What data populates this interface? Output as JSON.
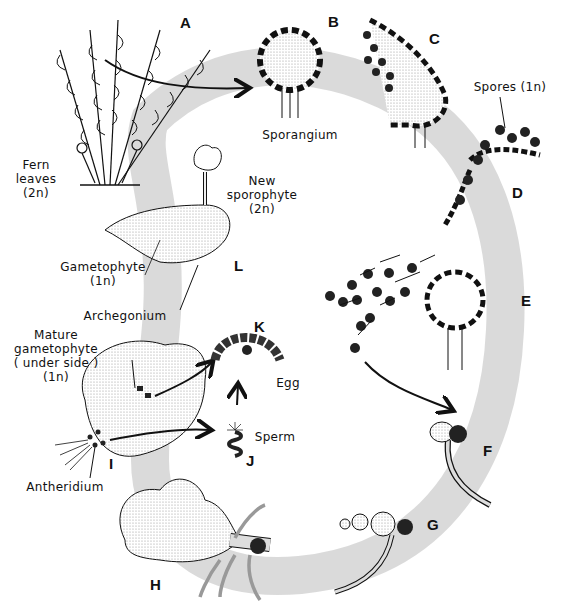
{
  "diagram": {
    "cycle_band_color": "#d4d4d4",
    "stages": [
      {
        "letter": "A",
        "description": "Fern leaves (sporophyte)"
      },
      {
        "letter": "B",
        "description": "Sporangium"
      },
      {
        "letter": "C",
        "description": "Sporangium opening, releasing spores"
      },
      {
        "letter": "D",
        "description": "Spores (1n) released"
      },
      {
        "letter": "E",
        "description": "Spores dispersing from sporangium"
      },
      {
        "letter": "F",
        "description": "Germinating spore"
      },
      {
        "letter": "G",
        "description": "Young filament"
      },
      {
        "letter": "H",
        "description": "Developing gametophyte"
      },
      {
        "letter": "I",
        "description": "Mature gametophyte (under side)"
      },
      {
        "letter": "J",
        "description": "Sperm"
      },
      {
        "letter": "K",
        "description": "Archegonium with egg"
      },
      {
        "letter": "L",
        "description": "Gametophyte with new sporophyte"
      }
    ],
    "labels": {
      "fern_leaves": [
        "Fern",
        "leaves",
        "(2n)"
      ],
      "sporangium": "Sporangium",
      "spores": "Spores (1n)",
      "new_sporophyte": [
        "New",
        "sporophyte",
        "(2n)"
      ],
      "gametophyte": [
        "Gametophyte",
        "(1n)"
      ],
      "archegonium": "Archegonium",
      "mature_gametophyte": [
        "Mature",
        "gametophyte",
        "( under side )",
        "(1n)"
      ],
      "egg": "Egg",
      "sperm": "Sperm",
      "antheridium": "Antheridium"
    }
  }
}
